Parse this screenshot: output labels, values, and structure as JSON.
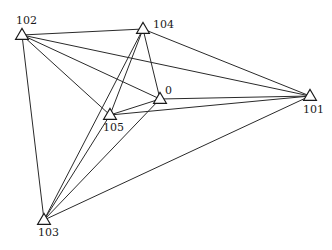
{
  "diagram": {
    "type": "network-graph",
    "node_shape": "triangle",
    "edge_color": "#2a2a2a",
    "node_stroke_color": "#1a1a1a",
    "background": "#ffffff",
    "nodes": [
      {
        "id": "102",
        "label": "102",
        "x": 22,
        "y": 35,
        "label_dx": -6,
        "label_dy": -11
      },
      {
        "id": "104",
        "label": "104",
        "x": 143,
        "y": 29,
        "label_dx": 10,
        "label_dy": -1
      },
      {
        "id": "0",
        "label": "0",
        "x": 160,
        "y": 99,
        "label_dx": 5,
        "label_dy": -5
      },
      {
        "id": "105",
        "label": "105",
        "x": 110,
        "y": 115,
        "label_dx": -7,
        "label_dy": 16
      },
      {
        "id": "101",
        "label": "101",
        "x": 310,
        "y": 96,
        "label_dx": -7,
        "label_dy": 17
      },
      {
        "id": "103",
        "label": "103",
        "x": 44,
        "y": 220,
        "label_dx": -6,
        "label_dy": 16
      }
    ],
    "edges": [
      [
        "102",
        "104"
      ],
      [
        "102",
        "101"
      ],
      [
        "102",
        "0"
      ],
      [
        "102",
        "105"
      ],
      [
        "102",
        "103"
      ],
      [
        "104",
        "101"
      ],
      [
        "104",
        "0"
      ],
      [
        "104",
        "105"
      ],
      [
        "104",
        "103"
      ],
      [
        "0",
        "105"
      ],
      [
        "0",
        "101"
      ],
      [
        "0",
        "103"
      ],
      [
        "105",
        "101"
      ],
      [
        "105",
        "103"
      ],
      [
        "103",
        "101"
      ]
    ]
  }
}
